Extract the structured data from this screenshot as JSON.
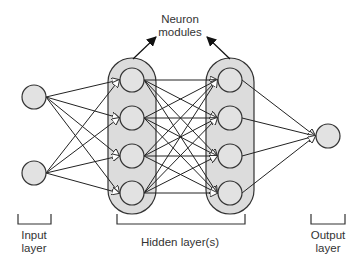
{
  "diagram": {
    "title_annotation": {
      "line1": "Neuron",
      "line2": "modules"
    },
    "labels": {
      "input": {
        "line1": "Input",
        "line2": "layer"
      },
      "hidden": "Hidden layer(s)",
      "output": {
        "line1": "Output",
        "line2": "layer"
      }
    },
    "colors": {
      "node_fill": "#e0e0e0",
      "stroke": "#333333",
      "module_fill": "#dcdcdc"
    },
    "layers": [
      {
        "name": "input",
        "nodes": 2
      },
      {
        "name": "hidden-1",
        "nodes": 4
      },
      {
        "name": "hidden-2",
        "nodes": 4
      },
      {
        "name": "output",
        "nodes": 1
      }
    ]
  }
}
